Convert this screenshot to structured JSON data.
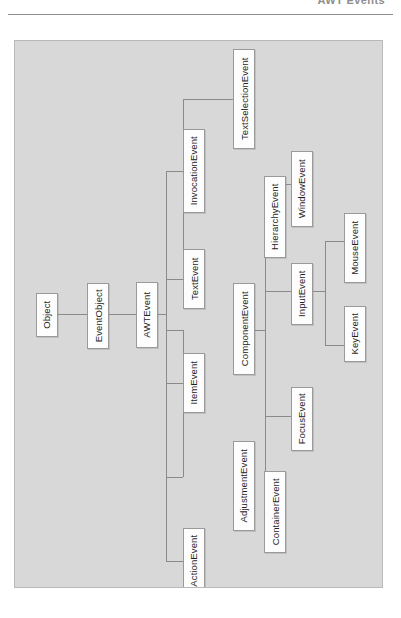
{
  "header": {
    "title": "AWT Events",
    "rule_color": "#8d8d8d"
  },
  "figure": {
    "panel_color": "#d8d8d8",
    "panel_border_color": "#b9b9b9",
    "node_fill": "#fdfdfd",
    "node_border": "#9a9a9a",
    "edge_color": "#8a8a8a",
    "orientation": "rotated-90-ccw"
  },
  "diagram": {
    "type": "class-hierarchy-tree",
    "root": "Object",
    "nodes": [
      {
        "id": "object",
        "label": "Object",
        "x": 35,
        "y": 292,
        "w": 22,
        "h": 44
      },
      {
        "id": "event-object",
        "label": "EventObject",
        "x": 86,
        "y": 282,
        "w": 22,
        "h": 66
      },
      {
        "id": "awt-event",
        "label": "AWTEvent",
        "x": 135,
        "y": 281,
        "w": 22,
        "h": 66
      },
      {
        "id": "text-event",
        "label": "TextEvent",
        "x": 182,
        "y": 277,
        "w": 22,
        "h": 60
      },
      {
        "id": "item-event",
        "label": "ItemEvent",
        "x": 182,
        "y": 381,
        "w": 22,
        "h": 60
      },
      {
        "id": "action-event",
        "label": "ActionEvent",
        "x": 182,
        "y": 490,
        "w": 22,
        "h": 66
      },
      {
        "id": "invocation-event",
        "label": "InvocationEvent",
        "x": 182,
        "y": 128,
        "w": 22,
        "h": 84
      },
      {
        "id": "component-event",
        "label": "ComponentEvent",
        "x": 232,
        "y": 282,
        "w": 22,
        "h": 92
      },
      {
        "id": "adjustment-event",
        "label": "AdjustmentEvent",
        "x": 232,
        "y": 440,
        "w": 22,
        "h": 90
      },
      {
        "id": "text-selection-event",
        "label": "TextSelectionEvent",
        "x": 232,
        "y": 48,
        "w": 22,
        "h": 100
      },
      {
        "id": "hierarchy-event",
        "label": "HierarchyEvent",
        "x": 263,
        "y": 175,
        "w": 22,
        "h": 82
      },
      {
        "id": "container-event",
        "label": "ContainerEvent",
        "x": 263,
        "y": 470,
        "w": 22,
        "h": 82
      },
      {
        "id": "input-event",
        "label": "InputEvent",
        "x": 290,
        "y": 262,
        "w": 22,
        "h": 62
      },
      {
        "id": "focus-event",
        "label": "FocusEvent",
        "x": 290,
        "y": 386,
        "w": 22,
        "h": 64
      },
      {
        "id": "window-event",
        "label": "WindowEvent",
        "x": 290,
        "y": 150,
        "w": 22,
        "h": 76
      },
      {
        "id": "mouse-event",
        "label": "MouseEvent",
        "x": 343,
        "y": 212,
        "w": 22,
        "h": 70
      },
      {
        "id": "key-event",
        "label": "KeyEvent",
        "x": 343,
        "y": 305,
        "w": 22,
        "h": 56
      }
    ],
    "edges": [
      {
        "from": "object",
        "to": "event-object"
      },
      {
        "from": "event-object",
        "to": "awt-event"
      },
      {
        "from": "awt-event",
        "to": "invocation-event"
      },
      {
        "from": "awt-event",
        "to": "text-event"
      },
      {
        "from": "awt-event",
        "to": "component-event"
      },
      {
        "from": "awt-event",
        "to": "item-event"
      },
      {
        "from": "awt-event",
        "to": "action-event"
      },
      {
        "from": "awt-event",
        "to": "adjustment-event"
      },
      {
        "from": "text-event",
        "to": "text-selection-event"
      },
      {
        "from": "component-event",
        "to": "hierarchy-event"
      },
      {
        "from": "component-event",
        "to": "input-event"
      },
      {
        "from": "component-event",
        "to": "focus-event"
      },
      {
        "from": "component-event",
        "to": "window-event"
      },
      {
        "from": "component-event",
        "to": "container-event"
      },
      {
        "from": "input-event",
        "to": "mouse-event"
      },
      {
        "from": "input-event",
        "to": "key-event"
      }
    ]
  }
}
